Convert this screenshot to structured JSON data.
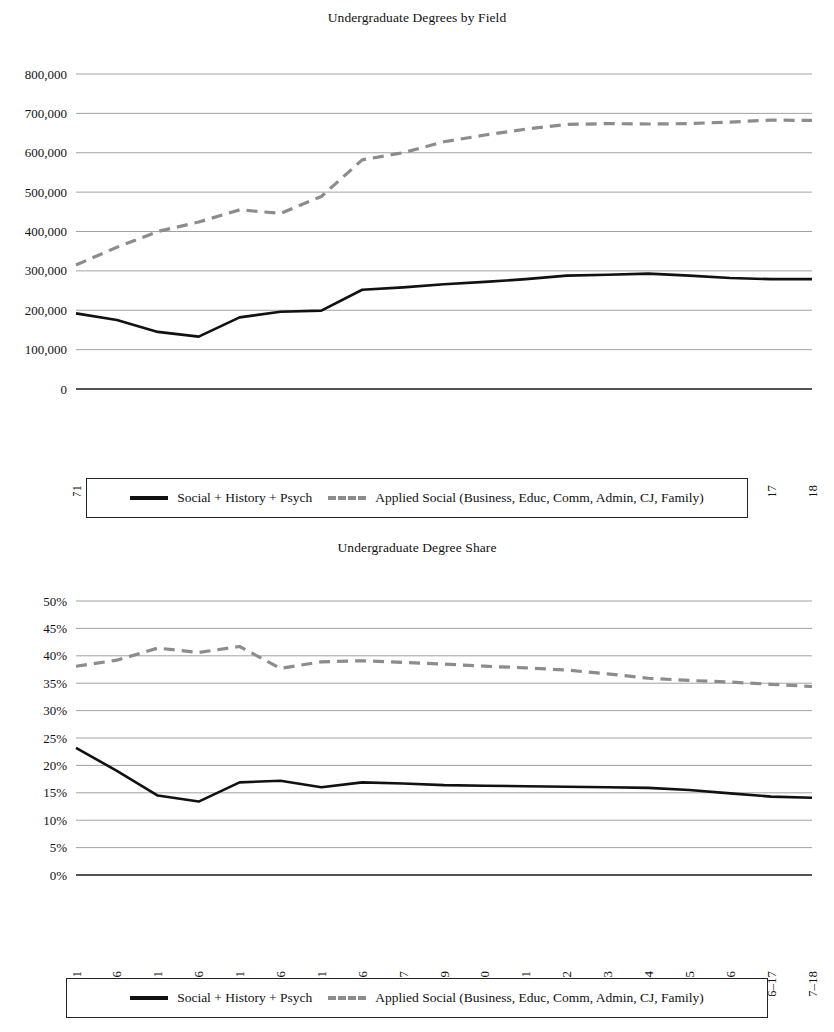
{
  "legend": {
    "series_solid_label": "Social + History + Psych",
    "series_dashed_label": "Applied Social (Business, Educ, Comm, Admin, CJ, Family)",
    "solid_color": "#111111",
    "dashed_color": "#8c8c8c"
  },
  "chart_data": [
    {
      "id": "undergraduate-degrees-by-field",
      "type": "line",
      "title": "Undergraduate Degrees by Field",
      "xlabel": "",
      "ylabel": "",
      "ylim": [
        0,
        800000
      ],
      "ytick_step": 100000,
      "grid": true,
      "legend_position": "bottom",
      "ytick_labels": [
        "0",
        "100,000",
        "200,000",
        "300,000",
        "400,000",
        "500,000",
        "600,000",
        "700,000",
        "800,000"
      ],
      "ytick_values": [
        0,
        100000,
        200000,
        300000,
        400000,
        500000,
        600000,
        700000,
        800000
      ],
      "categories": [
        "1970–71",
        "1975–76",
        "1980–81",
        "1985–86",
        "1990–91",
        "1995–96",
        "2000–01",
        "2005–06",
        "2006–07",
        "2008–09",
        "2009–10",
        "2010–11",
        "2011–12",
        "2012–13",
        "2013–14",
        "2014–15",
        "2015–16",
        "2016–17",
        "2017–18"
      ],
      "series": [
        {
          "name": "Social + History + Psych",
          "style": "solid",
          "values": [
            192000,
            175000,
            145000,
            133000,
            182000,
            196000,
            199000,
            252000,
            258000,
            266000,
            272000,
            279000,
            288000,
            290000,
            293000,
            288000,
            282000,
            279000,
            279000
          ]
        },
        {
          "name": "Applied Social (Business, Educ, Comm, Admin, CJ, Family)",
          "style": "dashed",
          "values": [
            315000,
            360000,
            400000,
            424000,
            455000,
            446000,
            489000,
            582000,
            600000,
            628000,
            645000,
            660000,
            672000,
            674000,
            673000,
            674000,
            678000,
            683000,
            682000
          ]
        }
      ]
    },
    {
      "id": "undergraduate-degree-share",
      "type": "line",
      "title": "Undergraduate Degree Share",
      "xlabel": "",
      "ylabel": "",
      "ylim": [
        0,
        0.5
      ],
      "ytick_step": 0.05,
      "grid": true,
      "legend_position": "bottom",
      "ytick_labels": [
        "0%",
        "5%",
        "10%",
        "15%",
        "20%",
        "25%",
        "30%",
        "35%",
        "40%",
        "45%",
        "50%"
      ],
      "ytick_values": [
        0,
        0.05,
        0.1,
        0.15,
        0.2,
        0.25,
        0.3,
        0.35,
        0.4,
        0.45,
        0.5
      ],
      "categories": [
        "1970–71",
        "1975–76",
        "1980–81",
        "1985–86",
        "1990–91",
        "1995–96",
        "2000–01",
        "2005–06",
        "2006–07",
        "2008–09",
        "2009–10",
        "2010–11",
        "2011–12",
        "2012–13",
        "2013–14",
        "2014–15",
        "2015–16",
        "2016–17",
        "2017–18"
      ],
      "series": [
        {
          "name": "Social + History + Psych",
          "style": "solid",
          "values": [
            0.232,
            0.19,
            0.145,
            0.134,
            0.169,
            0.172,
            0.16,
            0.169,
            0.167,
            0.164,
            0.163,
            0.162,
            0.161,
            0.16,
            0.159,
            0.155,
            0.149,
            0.143,
            0.141
          ]
        },
        {
          "name": "Applied Social (Business, Educ, Comm, Admin, CJ, Family)",
          "style": "dashed",
          "values": [
            0.381,
            0.392,
            0.414,
            0.406,
            0.417,
            0.377,
            0.389,
            0.391,
            0.388,
            0.385,
            0.381,
            0.378,
            0.374,
            0.367,
            0.359,
            0.355,
            0.352,
            0.348,
            0.344
          ]
        }
      ]
    }
  ]
}
